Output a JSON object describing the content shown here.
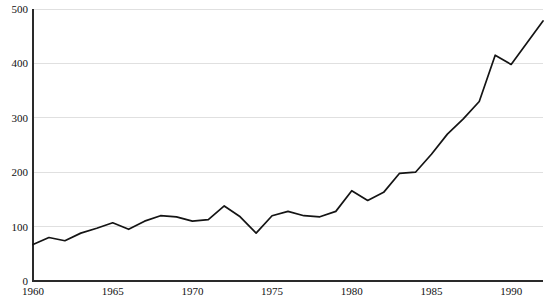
{
  "chart_data": {
    "type": "line",
    "title": "",
    "subtitle": "",
    "xlabel": "",
    "ylabel": "",
    "xlim": [
      1960,
      1992
    ],
    "ylim": [
      0,
      500
    ],
    "grid": true,
    "legend": "none",
    "x_ticks": [
      "1960",
      "1965",
      "1970",
      "1975",
      "1980",
      "1985",
      "1990"
    ],
    "x_tick_values": [
      1960,
      1965,
      1970,
      1975,
      1980,
      1985,
      1990
    ],
    "y_ticks": [
      "0",
      "100",
      "200",
      "300",
      "400",
      "500"
    ],
    "y_tick_values": [
      0,
      100,
      200,
      300,
      400,
      500
    ],
    "x": [
      1960,
      1961,
      1962,
      1963,
      1964,
      1965,
      1966,
      1967,
      1968,
      1969,
      1970,
      1971,
      1972,
      1973,
      1974,
      1975,
      1976,
      1977,
      1978,
      1979,
      1980,
      1981,
      1982,
      1983,
      1984,
      1985,
      1986,
      1987,
      1988,
      1989,
      1990,
      1991,
      1992
    ],
    "series": [
      {
        "name": "series-1",
        "color": "#141414",
        "values": [
          67,
          80,
          74,
          88,
          97,
          107,
          95,
          110,
          120,
          118,
          110,
          113,
          138,
          118,
          88,
          120,
          128,
          120,
          118,
          128,
          166,
          148,
          163,
          198,
          200,
          233,
          270,
          298,
          330,
          415,
          398,
          438,
          478
        ]
      }
    ]
  },
  "colors": {
    "axis": "#2a2a2a",
    "grid": "#d8d8d8",
    "line": "#141414",
    "background": "#ffffff"
  },
  "plot_geometry": {
    "left": 33,
    "right": 543,
    "top": 9,
    "bottom": 281
  }
}
